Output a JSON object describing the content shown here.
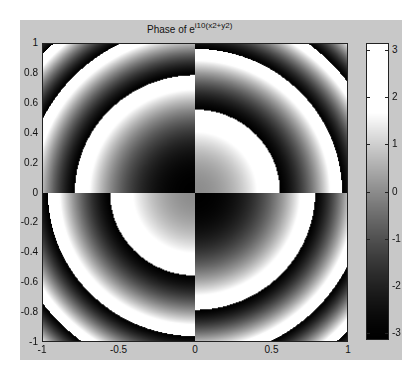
{
  "chart_data": {
    "type": "heatmap",
    "title_base": "Phase of e",
    "title_exponent": "i10(x2+y2)",
    "xlabel": "",
    "ylabel": "",
    "xlim": [
      -1,
      1
    ],
    "ylim": [
      -1,
      1
    ],
    "x_ticks": [
      "-1",
      "-0.5",
      "0",
      "0.5",
      "1"
    ],
    "y_ticks": [
      "1",
      "0.8",
      "0.6",
      "0.4",
      "0.2",
      "0",
      "-0.2",
      "-0.4",
      "-0.6",
      "-0.8",
      "-1"
    ],
    "function": "angle(exp(i*10*(x^2+y^2))), quadrant-wise sign flip (TL and BR quadrants shifted by pi)",
    "frequency": 10,
    "quadrant_offsets": {
      "top_left": 3.1416,
      "top_right": 0.0,
      "bottom_left": 0.0,
      "bottom_right": 3.1416
    },
    "colormap": "gray",
    "colorbar": {
      "ticks": [
        "3",
        "2",
        "1",
        "0",
        "-1",
        "-2",
        "-3"
      ],
      "range": [
        -3.1416,
        3.1416
      ]
    },
    "grid": false,
    "legend": "colorbar right"
  }
}
